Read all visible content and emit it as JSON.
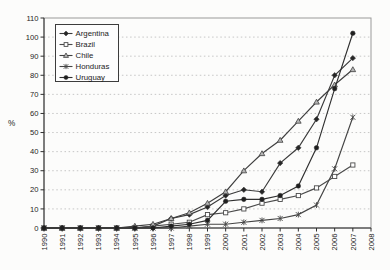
{
  "figure": {
    "background": "#fcfcfb",
    "plot_border_color": "#9a9a9a",
    "axis_color": "#2e2e2e",
    "gridline_color": "#b9b9b9",
    "text_color": "#1c1c1c"
  },
  "chart_data": {
    "type": "line",
    "title": "",
    "xlabel": "",
    "ylabel": "%",
    "ylim": [
      0,
      110
    ],
    "ytick_step": 10,
    "y_tick_labels": [
      "0",
      "10",
      "20",
      "30",
      "40",
      "50",
      "60",
      "70",
      "80",
      "90",
      "100",
      "110"
    ],
    "x_tick_labels": [
      "1990",
      "1991",
      "1992",
      "1993",
      "1994",
      "1995",
      "1996",
      "1997",
      "1998",
      "1999",
      "2000",
      "2001",
      "2002",
      "2003",
      "2004",
      "2005",
      "2006",
      "2007",
      "2008"
    ],
    "x": [
      1990,
      1991,
      1992,
      1993,
      1994,
      1995,
      1996,
      1997,
      1998,
      1999,
      2000,
      2001,
      2002,
      2003,
      2004,
      2005,
      2006,
      2007
    ],
    "grid": "horizontal-dotted",
    "legend_position": "top-left-inside",
    "series": [
      {
        "name": "Argentina",
        "marker": "filled-diamond",
        "color": "#3a3a3a",
        "fill": "#262626",
        "values": [
          0,
          0,
          0,
          0,
          0,
          0,
          1,
          5,
          7,
          11,
          17,
          20,
          19,
          34,
          42,
          57,
          80,
          89
        ]
      },
      {
        "name": "Brazil",
        "marker": "open-square",
        "color": "#4a4a4a",
        "fill": "#ffffff",
        "values": [
          0,
          0,
          0,
          0,
          0,
          0,
          1,
          2,
          3,
          7,
          8,
          10,
          13,
          15,
          17,
          21,
          27,
          33
        ]
      },
      {
        "name": "Chile",
        "marker": "triangle",
        "color": "#3f3f3f",
        "fill": "#b5b5b5",
        "values": [
          0,
          0,
          0,
          0,
          0,
          1,
          2,
          5,
          8,
          13,
          19,
          30,
          39,
          46,
          56,
          66,
          75,
          83
        ]
      },
      {
        "name": "Honduras",
        "marker": "asterisk",
        "color": "#444444",
        "fill": "#444444",
        "values": [
          0,
          0,
          0,
          0,
          0,
          0,
          0,
          0,
          1,
          2,
          2,
          3,
          4,
          5,
          7,
          12,
          31,
          58
        ]
      },
      {
        "name": "Uruguay",
        "marker": "filled-circle",
        "color": "#2f2f2f",
        "fill": "#1f1f1f",
        "values": [
          0,
          0,
          0,
          0,
          0,
          0,
          0,
          1,
          2,
          4,
          14,
          15,
          15,
          17,
          22,
          42,
          73,
          102
        ]
      }
    ]
  }
}
